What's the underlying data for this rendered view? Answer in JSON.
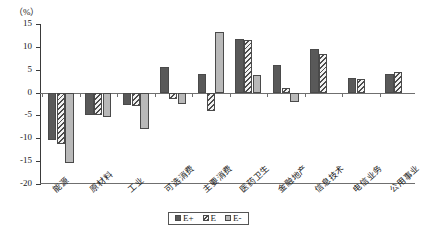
{
  "chart_data": {
    "type": "bar",
    "title": "",
    "subtitle": "",
    "unit_label": "（%）",
    "xlabel": "",
    "ylabel": "",
    "ylim": [
      -20,
      15
    ],
    "ytick_values": [
      15,
      10,
      5,
      0,
      -5,
      -10,
      -15,
      -20
    ],
    "ytick_labels": [
      "15",
      "10",
      "5",
      "0",
      "-5",
      "-10",
      "-15",
      "-20"
    ],
    "grid": false,
    "legend_position": "bottom-center",
    "categories": [
      "能源",
      "原材料",
      "工业",
      "可选消费",
      "主要消费",
      "医药卫生",
      "金融地产",
      "信息技术",
      "电信业务",
      "公用事业"
    ],
    "series": [
      {
        "name": "E+",
        "fill": "#595959",
        "values": [
          -10.4,
          -4.9,
          -2.8,
          5.6,
          4.0,
          11.7,
          6.1,
          9.6,
          3.2,
          4.1
        ]
      },
      {
        "name": "E",
        "fill": "#e9e9e9-hatch",
        "values": [
          -11.2,
          -4.9,
          -3.0,
          -1.5,
          -4.1,
          11.6,
          1.1,
          8.4,
          2.9,
          4.4
        ]
      },
      {
        "name": "E-",
        "fill": "#b9b9b9",
        "values": [
          -15.3,
          -5.3,
          -8.0,
          -2.5,
          13.2,
          3.8,
          -2.0,
          null,
          null,
          null
        ]
      }
    ]
  },
  "legend": {
    "items": [
      {
        "label": "E+"
      },
      {
        "label": "E"
      },
      {
        "label": "E-"
      }
    ]
  },
  "colors": {
    "series_e_plus": "#595959",
    "series_e": "#e9e9e9",
    "series_e_minus": "#b9b9b9",
    "axis": "#6f6f6f",
    "text": "#1a1a1a"
  }
}
